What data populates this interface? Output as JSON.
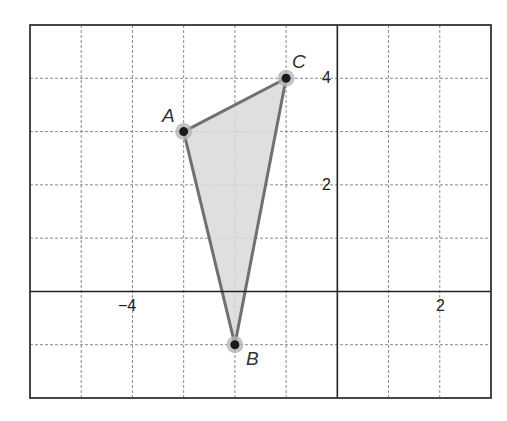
{
  "chart_data": {
    "type": "scatter",
    "title": "",
    "xlabel": "",
    "ylabel": "",
    "xlim": [
      -6,
      3
    ],
    "ylim": [
      -2,
      5
    ],
    "grid": true,
    "grid_style": "dashed",
    "x_tick_labels": [
      {
        "value": -4,
        "label": "−4"
      },
      {
        "value": 2,
        "label": "2"
      }
    ],
    "y_tick_labels": [
      {
        "value": 4,
        "label": "4"
      },
      {
        "value": 2,
        "label": "2"
      }
    ],
    "points": [
      {
        "name": "A",
        "x": -3,
        "y": 3
      },
      {
        "name": "B",
        "x": -2,
        "y": -1
      },
      {
        "name": "C",
        "x": -1,
        "y": 4
      }
    ],
    "polygon": {
      "vertices": [
        "A",
        "B",
        "C"
      ],
      "fill": "#d9d9d9",
      "stroke": "#707070"
    },
    "legend": null
  },
  "labels": {
    "A": "A",
    "B": "B",
    "C": "C",
    "x_neg4": "−4",
    "x_2": "2",
    "y_4": "4",
    "y_2": "2"
  },
  "colors": {
    "frame": "#333333",
    "grid": "#8a8a8a",
    "axis": "#222222",
    "fill": "#d9d9d9",
    "stroke": "#707070",
    "point": "#1a1a1a",
    "halo": "#b5b5b5"
  }
}
